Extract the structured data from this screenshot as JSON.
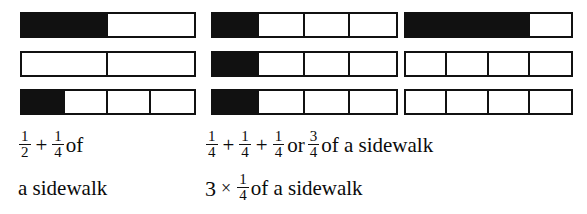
{
  "figure": {
    "type": "fraction-bar-diagram",
    "background_color": "#ffffff",
    "fill_color": "#111111",
    "stroke_color": "#111111",
    "groups": [
      {
        "name": "left-group",
        "label": "one half plus one quarter",
        "bars": [
          {
            "cells": 4,
            "filled": [
              true,
              true,
              false,
              false
            ],
            "segments": 2,
            "fraction_shaded": "1/2"
          },
          {
            "cells": 2,
            "filled": [
              false,
              false
            ],
            "segments": 2,
            "fraction_shaded": "0"
          },
          {
            "cells": 4,
            "filled": [
              true,
              false,
              false,
              false
            ],
            "segments": 4,
            "fraction_shaded": "1/4"
          }
        ]
      },
      {
        "name": "middle-group",
        "label": "one quarter three times",
        "bars": [
          {
            "cells": 4,
            "filled": [
              true,
              false,
              false,
              false
            ],
            "segments": 4,
            "fraction_shaded": "1/4"
          },
          {
            "cells": 4,
            "filled": [
              true,
              false,
              false,
              false
            ],
            "segments": 4,
            "fraction_shaded": "1/4"
          },
          {
            "cells": 4,
            "filled": [
              true,
              false,
              false,
              false
            ],
            "segments": 4,
            "fraction_shaded": "1/4"
          }
        ]
      },
      {
        "name": "right-group",
        "label": "three quarters",
        "bars": [
          {
            "cells": 4,
            "filled": [
              true,
              true,
              true,
              false
            ],
            "segments": 4,
            "fraction_shaded": "3/4"
          },
          {
            "cells": 4,
            "filled": [
              false,
              false,
              false,
              false
            ],
            "segments": 4,
            "fraction_shaded": "0"
          },
          {
            "cells": 4,
            "filled": [
              false,
              false,
              false,
              false
            ],
            "segments": 4,
            "fraction_shaded": "0"
          }
        ]
      }
    ]
  },
  "captions": {
    "left": {
      "line1": {
        "frac1": {
          "num": "1",
          "den": "2"
        },
        "op1": "+",
        "frac2": {
          "num": "1",
          "den": "4"
        },
        "word1": "of"
      },
      "line2": "a sidewalk"
    },
    "middle": {
      "line1": {
        "frac1": {
          "num": "1",
          "den": "4"
        },
        "op1": "+",
        "frac2": {
          "num": "1",
          "den": "4"
        },
        "op2": "+",
        "frac3": {
          "num": "1",
          "den": "4"
        },
        "word1": "or",
        "frac4": {
          "num": "3",
          "den": "4"
        },
        "word2": "of a sidewalk"
      },
      "line2": {
        "multiplier": "3",
        "op1": "×",
        "frac1": {
          "num": "1",
          "den": "4"
        },
        "word1": "of a sidewalk"
      }
    }
  }
}
